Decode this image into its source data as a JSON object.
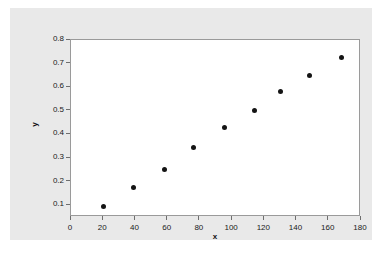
{
  "figure": {
    "background_color": "#ffffff",
    "canvas_color": "#e9e9e9",
    "plot_background_color": "#ffffff",
    "frame_color": "#9a9a9a",
    "marker_color": "#141414"
  },
  "chart_data": {
    "type": "scatter",
    "title": "",
    "xlabel": "x",
    "ylabel": "y",
    "xlim": [
      0,
      180
    ],
    "ylim": [
      0.05,
      0.8
    ],
    "xticks": [
      0,
      20,
      40,
      60,
      80,
      100,
      120,
      140,
      160,
      180
    ],
    "xtick_labels": [
      "0",
      "20",
      "40",
      "60",
      "80",
      "100",
      "120",
      "140",
      "160",
      "180"
    ],
    "yticks": [
      0.1,
      0.2,
      0.3,
      0.4,
      0.5,
      0.6,
      0.7,
      0.8
    ],
    "ytick_labels": [
      "0.1",
      "0.2",
      "0.3",
      "0.4",
      "0.5",
      "0.6",
      "0.7",
      "0.8"
    ],
    "grid": false,
    "legend": null,
    "series": [
      {
        "name": "observations",
        "marker": "filled-circle",
        "color": "#141414",
        "x": [
          20,
          39,
          58,
          76,
          95,
          114,
          130,
          148,
          168
        ],
        "y": [
          0.095,
          0.175,
          0.25,
          0.345,
          0.43,
          0.5,
          0.58,
          0.65,
          0.725
        ]
      }
    ]
  }
}
